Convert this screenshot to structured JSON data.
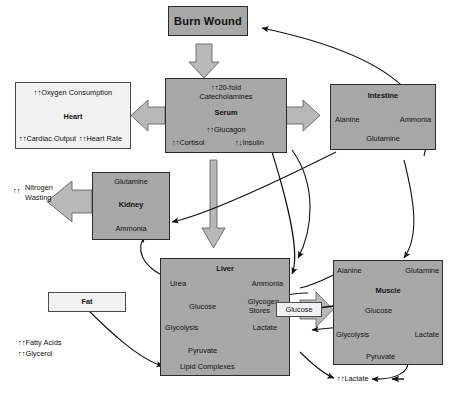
{
  "diagram": {
    "colors": {
      "box_fill": "#a8a8a8",
      "box_fill_light": "#f2f2f2",
      "block_arrow_fill": "#b8b8b8",
      "stroke": "#1a1a1a",
      "text": "#111111"
    }
  },
  "nodes": {
    "burn_wound": {
      "label": "Burn Wound"
    },
    "serum": {
      "line1": "↑↑20-fold",
      "line2": "Catecholamines",
      "title": "Serum",
      "line3": "↑↑Glucagon",
      "line4a": "↑↑Cortisol",
      "line4b": "↑↓Insulin"
    },
    "heart": {
      "top": "↑↑Oxygen Consumption",
      "title": "Heart",
      "bottom_left": "↑↑Cardiac Output",
      "bottom_right": "↑↑Heart Rate"
    },
    "intestine": {
      "title": "Intestine",
      "left": "Alanine",
      "right": "Ammonia",
      "bottom": "Glutamine"
    },
    "kidney": {
      "top": "Glutamine",
      "title": "Kidney",
      "bottom": "Ammonia"
    },
    "nitrogen_wasting": {
      "arrows": "↑↑",
      "line1": "Nitrogen",
      "line2": "Wasting"
    },
    "liver": {
      "title": "Liver",
      "urea": "Urea",
      "ammonia": "Ammonia",
      "glucose": "Glucose",
      "glycogen_l1": "Glycogen",
      "glycogen_l2": "Stores",
      "glycolysis": "Glycolysis",
      "lactate": "Lactate",
      "pyruvate": "Pyruvate",
      "lipid_complexes": "Lipid Complexes"
    },
    "muscle": {
      "alanine": "Alanine",
      "glutamine": "Glutamine",
      "title": "Muscle",
      "glucose": "Glucose",
      "glycolysis": "Glycolysis",
      "lactate": "Lactate",
      "pyruvate": "Pyruvate"
    },
    "fat": {
      "title": "Fat",
      "line1": "↑↑Fatty Acids",
      "line2": "↑↑Glycerol"
    },
    "glucose_transfer": {
      "label": "Glucose"
    },
    "lactate_output": {
      "label": "↑↑Lactate"
    }
  }
}
